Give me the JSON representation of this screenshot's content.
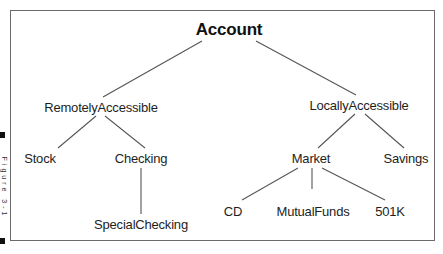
{
  "diagram": {
    "type": "class-hierarchy-tree",
    "nodes": [
      {
        "id": "account",
        "label": "Account",
        "x": 229,
        "y": 20,
        "root": true
      },
      {
        "id": "remote",
        "label": "RemotelyAccessible",
        "x": 101,
        "y": 100
      },
      {
        "id": "local",
        "label": "LocallyAccessible",
        "x": 359,
        "y": 98
      },
      {
        "id": "stock",
        "label": "Stock",
        "x": 40,
        "y": 151
      },
      {
        "id": "checking",
        "label": "Checking",
        "x": 141,
        "y": 151
      },
      {
        "id": "special",
        "label": "SpecialChecking",
        "x": 141,
        "y": 217
      },
      {
        "id": "market",
        "label": "Market",
        "x": 311,
        "y": 151
      },
      {
        "id": "savings",
        "label": "Savings",
        "x": 406,
        "y": 151
      },
      {
        "id": "cd",
        "label": "CD",
        "x": 233,
        "y": 204
      },
      {
        "id": "mutual",
        "label": "MutualFunds",
        "x": 313,
        "y": 204
      },
      {
        "id": "k501",
        "label": "501K",
        "x": 390,
        "y": 204
      }
    ],
    "edges": [
      {
        "from": "account",
        "to": "remote",
        "x1": 202,
        "y1": 41,
        "x2": 103,
        "y2": 97
      },
      {
        "from": "account",
        "to": "local",
        "x1": 256,
        "y1": 41,
        "x2": 356,
        "y2": 95
      },
      {
        "from": "remote",
        "to": "stock",
        "x1": 96,
        "y1": 116,
        "x2": 58,
        "y2": 148
      },
      {
        "from": "remote",
        "to": "checking",
        "x1": 105,
        "y1": 116,
        "x2": 145,
        "y2": 148
      },
      {
        "from": "checking",
        "to": "special",
        "x1": 141,
        "y1": 168,
        "x2": 141,
        "y2": 214
      },
      {
        "from": "local",
        "to": "market",
        "x1": 355,
        "y1": 114,
        "x2": 318,
        "y2": 148
      },
      {
        "from": "local",
        "to": "savings",
        "x1": 365,
        "y1": 114,
        "x2": 404,
        "y2": 148
      },
      {
        "from": "market",
        "to": "cd",
        "x1": 298,
        "y1": 168,
        "x2": 242,
        "y2": 200
      },
      {
        "from": "market",
        "to": "mutual",
        "x1": 312,
        "y1": 168,
        "x2": 312,
        "y2": 189
      },
      {
        "from": "market",
        "to": "k501",
        "x1": 322,
        "y1": 168,
        "x2": 385,
        "y2": 200
      }
    ],
    "colors": {
      "line": "#555555",
      "text": "#1e1e1e",
      "frame": "#6a6a6a"
    }
  },
  "side_label": {
    "text": "Figure 3-1"
  }
}
